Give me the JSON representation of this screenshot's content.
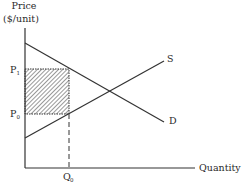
{
  "diagram": {
    "type": "supply-demand",
    "y_axis": {
      "label_line1": "Price",
      "label_line2": "($/unit)"
    },
    "x_axis": {
      "label": "Quantity"
    },
    "curves": {
      "supply": {
        "label": "S"
      },
      "demand": {
        "label": "D"
      }
    },
    "price_levels": {
      "p1": "P",
      "p1_sub": "1",
      "p0": "P",
      "p0_sub": "0"
    },
    "quantity_levels": {
      "q0": "Q",
      "q0_sub": "0"
    },
    "shaded_region": {
      "description": "hatched rectangle between P0 and P1 from 0 to Q0"
    },
    "colors": {
      "line": "#333333",
      "hatch": "#444444",
      "background": "#ffffff"
    }
  }
}
